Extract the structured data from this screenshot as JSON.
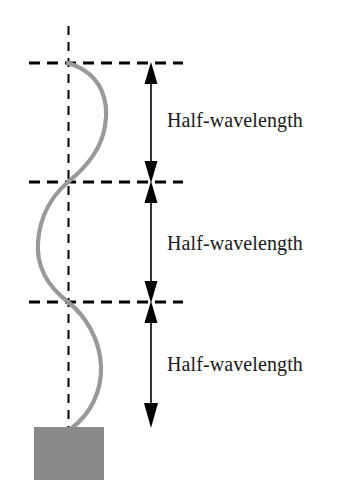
{
  "figure": {
    "background_color": "#ffffff",
    "width": 340,
    "height": 499
  },
  "colors": {
    "wave": "#999999",
    "block": "#8a8a8a",
    "ink": "#1a1a1a",
    "dashed": "#000000"
  },
  "labels": [
    {
      "id": "half-wavelength-top",
      "text": "Half-wavelength"
    },
    {
      "id": "half-wavelength-middle",
      "text": "Half-wavelength"
    },
    {
      "id": "half-wavelength-bottom",
      "text": "Half-wavelength"
    }
  ],
  "nodes": {
    "description": "Node positions along the vertical axis where the wave crosses the equilibrium line",
    "y_values": [
      63,
      182,
      302,
      427
    ]
  },
  "axis": {
    "equilibrium_x": 68,
    "top_y": 26,
    "bottom_y": 427
  },
  "dashed_lines": [
    {
      "id": "node-line-top",
      "y": 63,
      "x1": 29,
      "x2": 183
    },
    {
      "id": "node-line-middle",
      "y": 182,
      "x1": 29,
      "x2": 183
    },
    {
      "id": "node-line-lower",
      "y": 302,
      "x1": 29,
      "x2": 183
    }
  ],
  "dimension_arrows": [
    {
      "id": "dim-top",
      "x": 151,
      "y1": 63,
      "y2": 182,
      "label": "Half-wavelength"
    },
    {
      "id": "dim-middle",
      "x": 151,
      "y1": 182,
      "y2": 302,
      "label": "Half-wavelength"
    },
    {
      "id": "dim-bottom",
      "x": 151,
      "y1": 302,
      "y2": 427,
      "label": "Half-wavelength"
    }
  ],
  "block": {
    "id": "end-mass-block",
    "x": 34,
    "y": 427,
    "width": 70,
    "height": 53
  },
  "wave": {
    "id": "standing-wave-curve",
    "stroke_width": 4,
    "lobes": [
      {
        "direction": "right",
        "peak_x": 105,
        "peak_y": 124,
        "from_y": 63,
        "to_y": 182
      },
      {
        "direction": "left",
        "peak_x": 38,
        "peak_y": 242,
        "from_y": 182,
        "to_y": 302
      },
      {
        "direction": "right",
        "peak_x": 101,
        "peak_y": 365,
        "from_y": 302,
        "to_y": 427
      }
    ]
  }
}
